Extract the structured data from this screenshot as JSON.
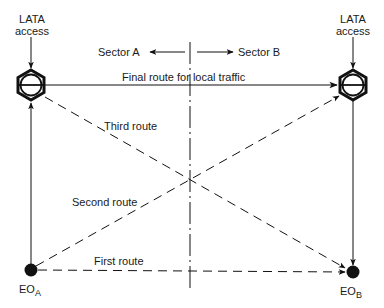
{
  "diagram": {
    "type": "telecom-routing-diagram",
    "colors": {
      "ink": "#111111",
      "background": "#ffffff"
    },
    "nodes": {
      "tandem_a": {
        "label_line1": "LATA",
        "label_line2": "access",
        "icon": "tandem-switch-hexagon-icon"
      },
      "tandem_b": {
        "label_line1": "LATA",
        "label_line2": "access",
        "icon": "tandem-switch-hexagon-icon"
      },
      "eo_a": {
        "label": "EO",
        "subscript": "A",
        "icon": "end-office-dot-icon"
      },
      "eo_b": {
        "label": "EO",
        "subscript": "B",
        "icon": "end-office-dot-icon"
      }
    },
    "sectors": {
      "left": "Sector A",
      "right": "Sector B"
    },
    "routes": {
      "final": "Final route for local traffic",
      "first": "First route",
      "second": "Second route",
      "third": "Third route"
    }
  }
}
